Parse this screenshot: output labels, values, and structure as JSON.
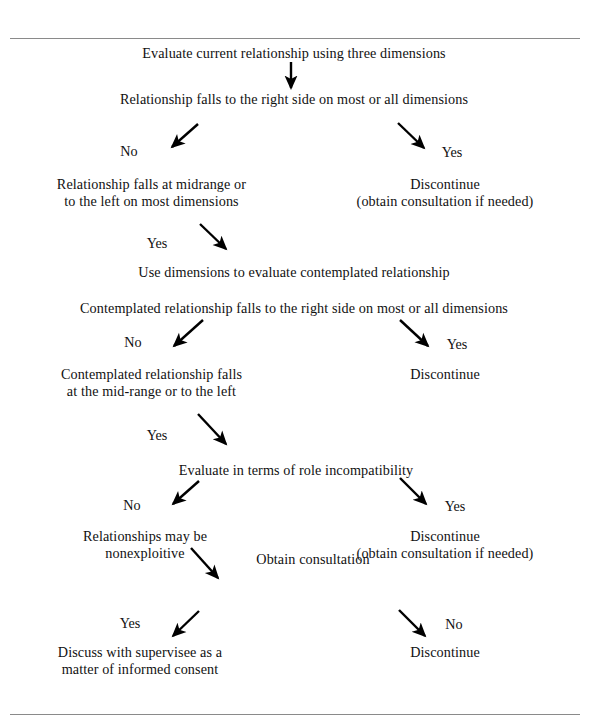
{
  "figure": {
    "type": "decision-flowchart",
    "rules": {
      "top_label": "",
      "bottom_label": ""
    },
    "colors": {
      "text": "#111111",
      "rule": "#8a8a8a",
      "arrow": "#000000",
      "background": "#ffffff"
    }
  },
  "nodes": [
    {
      "id": "n1",
      "text": "Evaluate current relationship using three dimensions"
    },
    {
      "id": "n2",
      "text": "Relationship falls to the right side on most or all dimensions"
    },
    {
      "id": "n3",
      "text": "Relationship falls at midrange or\nto the left on most dimensions"
    },
    {
      "id": "n4",
      "text": "Discontinue\n(obtain consultation if needed)"
    },
    {
      "id": "n5",
      "text": "Use dimensions to evaluate contemplated relationship"
    },
    {
      "id": "n6",
      "text": "Contemplated relationship falls to the right side on most or all dimensions"
    },
    {
      "id": "n7",
      "text": "Contemplated relationship falls\nat the mid-range or to the left"
    },
    {
      "id": "n8",
      "text": "Discontinue"
    },
    {
      "id": "n9",
      "text": "Evaluate in terms of role incompatibility"
    },
    {
      "id": "n10",
      "text": "Relationships may be\nnonexploitive"
    },
    {
      "id": "n11",
      "text": "Discontinue\n(obtain consultation if needed)"
    },
    {
      "id": "n12",
      "text": "Obtain consultation"
    },
    {
      "id": "n13",
      "text": "Discuss with supervisee as a\nmatter of informed consent"
    },
    {
      "id": "n14",
      "text": "Discontinue"
    }
  ],
  "edge_labels": [
    {
      "id": "e1",
      "text": "No"
    },
    {
      "id": "e2",
      "text": "Yes"
    },
    {
      "id": "e3",
      "text": "Yes"
    },
    {
      "id": "e4",
      "text": "No"
    },
    {
      "id": "e5",
      "text": "Yes"
    },
    {
      "id": "e6",
      "text": "Yes"
    },
    {
      "id": "e7",
      "text": "No"
    },
    {
      "id": "e8",
      "text": "Yes"
    },
    {
      "id": "e9",
      "text": "Yes"
    },
    {
      "id": "e10",
      "text": "No"
    }
  ],
  "arrows": [
    {
      "id": "a0",
      "from": [
        291,
        62
      ],
      "to": [
        291,
        90
      ],
      "direction": "down"
    },
    {
      "id": "a1",
      "from": [
        198,
        124
      ],
      "to": [
        170,
        149
      ],
      "direction": "down-left"
    },
    {
      "id": "a2",
      "from": [
        398,
        123
      ],
      "to": [
        426,
        150
      ],
      "direction": "down-right"
    },
    {
      "id": "a3",
      "from": [
        200,
        224
      ],
      "to": [
        228,
        251
      ],
      "direction": "down-right"
    },
    {
      "id": "a4",
      "from": [
        203,
        320
      ],
      "to": [
        172,
        348
      ],
      "direction": "down-left"
    },
    {
      "id": "a5",
      "from": [
        400,
        320
      ],
      "to": [
        430,
        348
      ],
      "direction": "down-right"
    },
    {
      "id": "a6",
      "from": [
        198,
        414
      ],
      "to": [
        228,
        446
      ],
      "direction": "down-right"
    },
    {
      "id": "a7",
      "from": [
        199,
        481
      ],
      "to": [
        171,
        506
      ],
      "direction": "down-left"
    },
    {
      "id": "a8",
      "from": [
        400,
        478
      ],
      "to": [
        428,
        506
      ],
      "direction": "down-right"
    },
    {
      "id": "a9",
      "from": [
        191,
        548
      ],
      "to": [
        220,
        580
      ],
      "direction": "down-right"
    },
    {
      "id": "a10",
      "from": [
        199,
        611
      ],
      "to": [
        171,
        638
      ],
      "direction": "down-left"
    },
    {
      "id": "a11",
      "from": [
        399,
        610
      ],
      "to": [
        427,
        638
      ],
      "direction": "down-right"
    }
  ]
}
